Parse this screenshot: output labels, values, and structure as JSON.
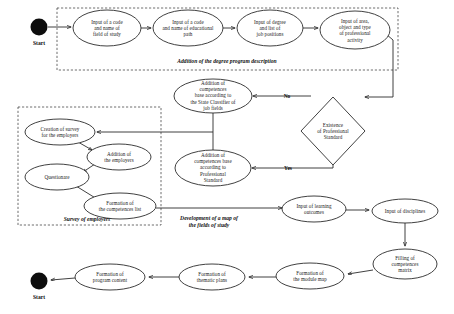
{
  "diagram": {
    "type": "activity-flowchart",
    "terminals": [
      {
        "id": "start-top",
        "label": "Start",
        "cx": 39,
        "cy": 27,
        "r": 8.5,
        "label_x": 39,
        "label_y": 43
      },
      {
        "id": "start-bottom",
        "label": "Start",
        "cx": 39,
        "cy": 281,
        "r": 8.5,
        "label_x": 39,
        "label_y": 297
      }
    ],
    "nodes": [
      {
        "id": "input-code-field",
        "label": "Input of a code\nand name of\nfield of study",
        "cx": 107,
        "cy": 28,
        "rx": 34,
        "ry": 18
      },
      {
        "id": "input-code-path",
        "label": "Input of a code\nand name of educational\npath",
        "cx": 188,
        "cy": 28,
        "rx": 35,
        "ry": 18
      },
      {
        "id": "input-degree-jobs",
        "label": "Input of degree\nand list of\njob positions",
        "cx": 270,
        "cy": 28,
        "rx": 33,
        "ry": 18
      },
      {
        "id": "input-area-activity",
        "label": "Input of area,\nobject and type\nof professional\nactivity",
        "cx": 355,
        "cy": 30,
        "rx": 35,
        "ry": 19
      },
      {
        "id": "add-comp-classifier",
        "label": "Addition of\ncompetences\nbase according to\nthe State Classifier of\njob fields",
        "cx": 213,
        "cy": 96,
        "rx": 39,
        "ry": 17
      },
      {
        "id": "add-comp-standard",
        "label": "Addition of\ncompetences base\naccording to\nProfessional\nStandard",
        "cx": 213,
        "cy": 168,
        "rx": 38,
        "ry": 18
      },
      {
        "id": "creation-survey",
        "label": "Creation of survey\nfor the employers",
        "cx": 60,
        "cy": 132,
        "rx": 35,
        "ry": 13
      },
      {
        "id": "addition-employers",
        "label": "Addition of\nthe employers",
        "cx": 119,
        "cy": 157,
        "rx": 32,
        "ry": 13
      },
      {
        "id": "questionare",
        "label": "Questionare",
        "cx": 57,
        "cy": 177,
        "rx": 32,
        "ry": 13
      },
      {
        "id": "formation-comp-list",
        "label": "Formation of\nthe competences list",
        "cx": 120,
        "cy": 206,
        "rx": 36,
        "ry": 13
      },
      {
        "id": "input-learning-outcomes",
        "label": "Input of learning\noutcomes",
        "cx": 314,
        "cy": 209,
        "rx": 32,
        "ry": 13
      },
      {
        "id": "input-disciplines",
        "label": "Input of disciplines",
        "cx": 405,
        "cy": 211,
        "rx": 33,
        "ry": 12
      },
      {
        "id": "filling-comp-matrix",
        "label": "Filling of\ncompetences\nmatrix",
        "cx": 405,
        "cy": 264,
        "rx": 32,
        "ry": 15
      },
      {
        "id": "formation-module-map",
        "label": "Formation of\nthe module map",
        "cx": 310,
        "cy": 276,
        "rx": 34,
        "ry": 13
      },
      {
        "id": "formation-thematic-plans",
        "label": "Formation of\nthematic plans",
        "cx": 212,
        "cy": 277,
        "rx": 33,
        "ry": 13
      },
      {
        "id": "formation-program-content",
        "label": "Formation of\nprogram content",
        "cx": 110,
        "cy": 277,
        "rx": 35,
        "ry": 13
      }
    ],
    "decision": {
      "id": "existence-professional-standard",
      "label": "Existence\nof Professional\nStandard",
      "cx": 333,
      "cy": 131,
      "rx": 32,
      "ry": 34
    },
    "edge_labels": [
      {
        "id": "branch-no",
        "label": "No",
        "x": 287,
        "y": 96
      },
      {
        "id": "branch-yes",
        "label": "Yes",
        "x": 288,
        "y": 168
      }
    ],
    "groups": [
      {
        "id": "group-degree-description",
        "label": "Addition of the degree program description",
        "x": 57,
        "y": 8,
        "width": 341,
        "height": 62,
        "label_x": 227,
        "label_y": 61
      },
      {
        "id": "group-survey-employers",
        "label": "Survey of employers",
        "x": 18,
        "y": 107,
        "width": 143,
        "height": 118,
        "label_x": 87,
        "label_y": 219
      }
    ],
    "free_labels": [
      {
        "id": "label-map-fields-of-study",
        "label": "Development of a map of\nthe fields of study",
        "x": 209,
        "y": 222
      }
    ]
  }
}
